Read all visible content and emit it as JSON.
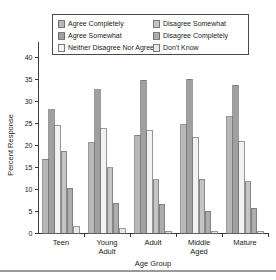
{
  "chart_data": {
    "type": "bar",
    "title": "",
    "xlabel": "Age Group",
    "ylabel": "Percent Response",
    "categories": [
      "Teen",
      "Young Adult",
      "Adult",
      "Middle Aged",
      "Mature"
    ],
    "ylim": [
      0,
      40
    ],
    "yticks": [
      0,
      5,
      10,
      15,
      20,
      25,
      30,
      35,
      40
    ],
    "ytick_labels": [
      "0",
      "5",
      "10",
      "15",
      "20",
      "25",
      "30",
      "35",
      "40"
    ],
    "grid": false,
    "legend_position": "top-inside",
    "series": [
      {
        "name": "Agree Completely",
        "color": "#b8b8b8",
        "values": [
          16.8,
          20.5,
          22.2,
          24.6,
          26.4
        ]
      },
      {
        "name": "Agree Somewhat",
        "color": "#a0a0a0",
        "values": [
          28.0,
          32.6,
          34.7,
          35.0,
          33.6
        ]
      },
      {
        "name": "Neither Disagree Nor Agree",
        "color": "#f2f2f2",
        "values": [
          24.4,
          23.7,
          23.2,
          21.8,
          20.9
        ]
      },
      {
        "name": "Disagree Somewhat",
        "color": "#c4c4c4",
        "values": [
          18.6,
          14.8,
          12.1,
          12.2,
          11.6
        ]
      },
      {
        "name": "Disagree Completely",
        "color": "#adadad",
        "values": [
          10.2,
          6.8,
          6.5,
          4.9,
          5.6
        ]
      },
      {
        "name": "Don't Know",
        "color": "#e8e8e8",
        "values": [
          1.4,
          1.0,
          0.4,
          0.3,
          0.3
        ]
      }
    ],
    "category_label_lines": [
      [
        "Teen"
      ],
      [
        "Young",
        "Adult"
      ],
      [
        "Adult"
      ],
      [
        "Middle",
        "Aged"
      ],
      [
        "Mature"
      ]
    ]
  }
}
